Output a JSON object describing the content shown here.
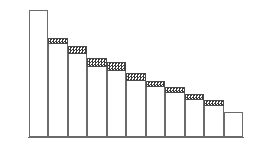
{
  "chart_data": {
    "type": "bar",
    "title": "",
    "subtitle": "",
    "xlabel": "",
    "ylabel": "",
    "categories": [
      "1",
      "2",
      "3",
      "4",
      "5",
      "6",
      "7",
      "8",
      "9",
      "10",
      "11"
    ],
    "tick_labels": [],
    "grid": false,
    "legend": [],
    "legend_position": "none",
    "stacked": true,
    "ylim": [
      0,
      100
    ],
    "series": [
      {
        "name": "base",
        "values": [
          100,
          73,
          66,
          55,
          52,
          44,
          39,
          34,
          29,
          24,
          20
        ]
      },
      {
        "name": "cap",
        "values": [
          0,
          5,
          6,
          7,
          7,
          6,
          5,
          5,
          5,
          5,
          0
        ]
      }
    ],
    "totals": [
      100,
      78,
      72,
      62,
      59,
      50,
      44,
      39,
      34,
      29,
      20
    ],
    "annotations": []
  },
  "figure": {
    "background_color": "#ffffff",
    "bar_fill_color": "#ffffff",
    "bar_edge_color": "#6b6b6b",
    "cap_pattern": "checkerboard-hatch",
    "cap_pattern_color": "#3a3a3a",
    "cap_edge_color": "#4a4a4a",
    "baseline_color": "#6b6b6b",
    "bar_count": 11
  },
  "accessibility": {
    "description": "Descending bar chart with eleven white bars; the second through tenth bars are topped with a dark checkered hatched band."
  }
}
